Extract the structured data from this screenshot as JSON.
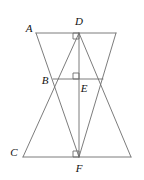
{
  "figure": {
    "stroke_color": "#6d6d6d",
    "label_color": "#111111",
    "background_color": "#ffffff",
    "stroke_width": 0.9,
    "view": {
      "width": 144,
      "height": 180
    }
  },
  "points": {
    "A": {
      "x": 36,
      "y": 33,
      "label": "A",
      "label_x": 29,
      "label_y": 28
    },
    "D": {
      "x": 79,
      "y": 33,
      "label": "D",
      "label_x": 79,
      "label_y": 21
    },
    "B": {
      "x": 53,
      "y": 79,
      "label": "B",
      "label_x": 45,
      "label_y": 80
    },
    "E": {
      "x": 79,
      "y": 79,
      "label": "E",
      "label_x": 84,
      "label_y": 88
    },
    "C": {
      "x": 23,
      "y": 157,
      "label": "C",
      "label_x": 14,
      "label_y": 152
    },
    "F": {
      "x": 79,
      "y": 157,
      "label": "F",
      "label_x": 79,
      "label_y": 168
    },
    "TR": {
      "x": 116,
      "y": 33,
      "label": "",
      "label_x": 0,
      "label_y": 0
    },
    "BR": {
      "x": 131,
      "y": 157,
      "label": "",
      "label_x": 0,
      "label_y": 0
    },
    "BE_LEFT": {
      "x": 53,
      "y": 79
    },
    "BE_RIGHT": {
      "x": 103,
      "y": 79
    }
  },
  "segments": [
    {
      "name": "segment-A-TR-top-edge",
      "x1": 36,
      "y1": 33,
      "x2": 116,
      "y2": 33
    },
    {
      "name": "segment-C-BR-bottom-edge",
      "x1": 23,
      "y1": 157,
      "x2": 131,
      "y2": 157
    },
    {
      "name": "segment-D-F-altitude",
      "x1": 79,
      "y1": 33,
      "x2": 79,
      "y2": 157
    },
    {
      "name": "segment-B-E-horizontal",
      "x1": 53,
      "y1": 79,
      "x2": 103,
      "y2": 79
    },
    {
      "name": "segment-A-F-left-side-upper-triangle",
      "x1": 36,
      "y1": 33,
      "x2": 79,
      "y2": 157
    },
    {
      "name": "segment-TR-F-right-side-upper-triangle",
      "x1": 116,
      "y1": 33,
      "x2": 79,
      "y2": 157
    },
    {
      "name": "segment-C-D-left-side-lower-triangle",
      "x1": 23,
      "y1": 157,
      "x2": 79,
      "y2": 33
    },
    {
      "name": "segment-BR-D-right-side-lower-triangle",
      "x1": 131,
      "y1": 157,
      "x2": 79,
      "y2": 33
    }
  ],
  "right_angle_marks": [
    {
      "name": "right-angle-mark-at-D",
      "x": 73,
      "y": 33,
      "size": 6,
      "dir_x": 1,
      "dir_y": 1
    },
    {
      "name": "right-angle-mark-at-E",
      "x": 73,
      "y": 73,
      "size": 6,
      "dir_x": 1,
      "dir_y": 1
    },
    {
      "name": "right-angle-mark-at-F",
      "x": 73,
      "y": 151,
      "size": 6,
      "dir_x": 1,
      "dir_y": 1
    }
  ],
  "labels_order": [
    "A",
    "D",
    "B",
    "E",
    "C",
    "F"
  ]
}
